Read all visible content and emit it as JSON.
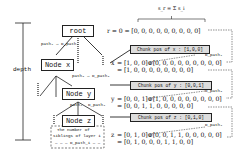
{
  "depth_label": "depth",
  "formula_top": "s_r = Σ s_i",
  "nodes": {
    "root": "root",
    "x": "Node x",
    "y": "Node y",
    "z": "Node z"
  },
  "edge_labels": {
    "root_to_x": "path₁ → D_path₁",
    "x_to_y": "path₂ → D_path₂",
    "y_left": "path₃",
    "y_right": "D_path₃"
  },
  "siblings_note": "The number of siblings of layer i → len(D_path_i)",
  "siblings_note_line1": "The number of",
  "siblings_note_line2": "siblings of layer i",
  "siblings_note_line3": "— — — D_path_i — —",
  "rows": {
    "r": {
      "var": "r",
      "eq": "= 0 =",
      "vector": "[0, 0, 0, 0, 0, 0, 0, 0, 0]"
    },
    "x": {
      "chunk": "Chunk pos of x : [1,0,0]",
      "var": "x",
      "line1": "= [1, 0, 0]⊕[0, 0, 0, 0, 0, 0, 0, 0, 0]",
      "line2": "= [1, 0, 0, 0, 0, 0, 0, 0, 0]",
      "dlabel": "D_path₁"
    },
    "y": {
      "chunk": "Chunk pos of y : [0,0,1]",
      "var": "y",
      "line1": "= [0, 0, 1]⊕[1, 0, 0, 0, 0, 0, 0, 0, 0]",
      "line2": "= [0, 0, 1, 1, 0, 0, 0, 0, 0]",
      "dlabel": "D_path₂"
    },
    "z": {
      "chunk": "Chunk pos of z : [0,1,0]",
      "var": "z",
      "line1": "= [0, 1, 0]⊕[0, 0, 1, 1, 0, 0, 0, 0, 0]",
      "line2": "= [0, 1, 0, 0, 0, 1, 1, 0, 0]",
      "dlabel": "D_path₃"
    }
  }
}
